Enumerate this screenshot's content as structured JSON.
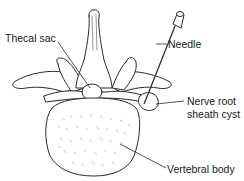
{
  "diagram": {
    "colors": {
      "line": "#2a2a2a",
      "fill": "#ffffff",
      "stipple": "#8a8a8a"
    },
    "labels": {
      "thecal_sac": "Thecal sac",
      "needle": "Needle",
      "nerve_root_line1": "Nerve root",
      "nerve_root_line2": "sheath cyst",
      "vertebral_body": "Vertebral body"
    }
  }
}
